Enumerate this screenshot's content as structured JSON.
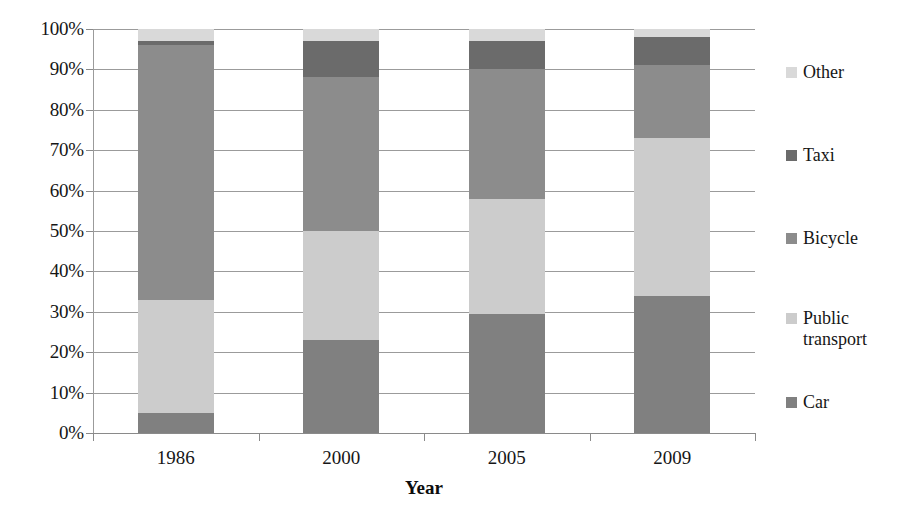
{
  "chart_data": {
    "type": "bar",
    "subtype": "stacked-bar-100-percent",
    "title": "",
    "xlabel": "Year",
    "ylabel": "",
    "categories": [
      "1986",
      "2000",
      "2005",
      "2009"
    ],
    "ylim": [
      0,
      100
    ],
    "ytick_labels": [
      "0%",
      "10%",
      "20%",
      "30%",
      "40%",
      "50%",
      "60%",
      "70%",
      "80%",
      "90%",
      "100%"
    ],
    "ytick_values": [
      0,
      10,
      20,
      30,
      40,
      50,
      60,
      70,
      80,
      90,
      100
    ],
    "grid": true,
    "legend_position": "right",
    "stack_order_bottom_to_top": [
      "Car",
      "Public transport",
      "Bicycle",
      "Taxi",
      "Other"
    ],
    "series": [
      {
        "name": "Car",
        "color": "#808080",
        "values": [
          5,
          23,
          29.5,
          34
        ]
      },
      {
        "name": "Public transport",
        "color": "#cccccc",
        "values": [
          28,
          27,
          28.5,
          39
        ]
      },
      {
        "name": "Bicycle",
        "color": "#8c8c8c",
        "values": [
          63,
          38,
          32,
          18
        ]
      },
      {
        "name": "Taxi",
        "color": "#6b6b6b",
        "values": [
          1,
          9,
          7,
          7
        ]
      },
      {
        "name": "Other",
        "color": "#d9d9d9",
        "values": [
          3,
          3,
          3,
          2
        ]
      }
    ],
    "legend_entries_top_to_bottom": [
      {
        "label": "Other",
        "color": "#d9d9d9"
      },
      {
        "label": "Taxi",
        "color": "#6b6b6b"
      },
      {
        "label": "Bicycle",
        "color": "#8c8c8c"
      },
      {
        "label": "Public\ntransport",
        "color": "#cccccc"
      },
      {
        "label": "Car",
        "color": "#808080"
      }
    ],
    "colors": {
      "gridline": "#9b9b9b",
      "axis": "#8a8a8a",
      "text": "#161616",
      "background": "#ffffff"
    }
  }
}
